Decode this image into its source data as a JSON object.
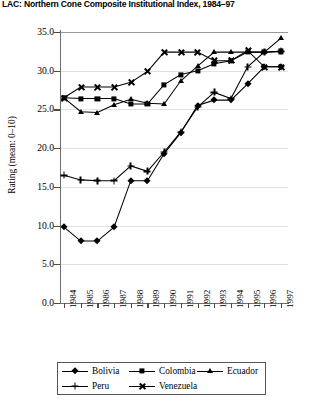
{
  "chart_data": {
    "type": "line",
    "title": "LAC: Northern Cone Composite Institutional Index, 1984–97",
    "xlabel": "",
    "ylabel": "Rating (mean: 0–10)",
    "ylim": [
      0.0,
      35.0
    ],
    "yticks": [
      "0.0",
      "5.0",
      "10.0",
      "15.0",
      "20.0",
      "25.0",
      "30.0",
      "35.0"
    ],
    "ytick_values": [
      0.0,
      5.0,
      10.0,
      15.0,
      20.0,
      25.0,
      30.0,
      35.0
    ],
    "categories": [
      "1984",
      "1985",
      "1986",
      "1987",
      "1988",
      "1989",
      "1990",
      "1991",
      "1992",
      "1993",
      "1994",
      "1995",
      "1996",
      "1997"
    ],
    "grid": true,
    "legend_position": "bottom",
    "series": [
      {
        "name": "Bolivia",
        "marker": "diamond",
        "values": [
          9.8,
          8.0,
          8.0,
          9.8,
          15.8,
          15.8,
          19.3,
          22.0,
          25.5,
          26.2,
          26.2,
          28.3,
          30.5,
          30.5
        ]
      },
      {
        "name": "Colombia",
        "marker": "square",
        "values": [
          26.5,
          26.4,
          26.4,
          26.4,
          25.7,
          25.7,
          28.2,
          29.5,
          30.0,
          30.9,
          31.3,
          32.4,
          32.4,
          32.5
        ]
      },
      {
        "name": "Ecuador",
        "marker": "triangle",
        "values": [
          26.5,
          24.7,
          24.6,
          25.6,
          26.3,
          25.8,
          25.7,
          28.7,
          30.6,
          32.4,
          32.4,
          32.4,
          32.4,
          34.2
        ]
      },
      {
        "name": "Peru",
        "marker": "plus",
        "values": [
          16.5,
          15.9,
          15.8,
          15.8,
          17.7,
          17.0,
          19.5,
          22.1,
          25.3,
          27.2,
          26.4,
          30.5,
          32.4,
          32.5
        ]
      },
      {
        "name": "Venezuela",
        "marker": "x",
        "values": [
          26.5,
          27.9,
          27.9,
          27.9,
          28.5,
          29.9,
          32.4,
          32.4,
          32.4,
          31.3,
          31.3,
          32.6,
          30.5,
          30.5
        ]
      }
    ]
  }
}
